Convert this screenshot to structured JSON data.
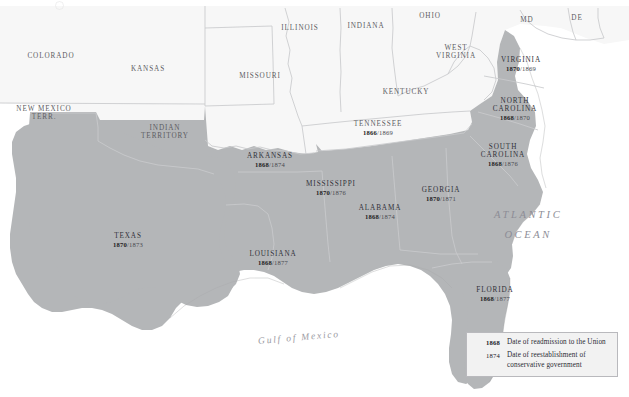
{
  "map": {
    "title": "Reconstruction of the Southern States",
    "colors": {
      "reconstructed_fill": "#b4b6b8",
      "union_fill": "#f7f7f7",
      "ocean_fill": "#ffffff",
      "border_stroke": "#c9cacc",
      "coast_stroke": "#a8a9ab",
      "label_text": "#3b3b40",
      "legend_bg": "#f2f2f2",
      "legend_border": "#b9b9bd"
    },
    "water_labels": [
      {
        "name": "atlantic-ocean",
        "line1": "ATLANTIC",
        "line2": "OCEAN"
      },
      {
        "name": "gulf-of-mexico",
        "text": "Gulf of Mexico"
      }
    ],
    "reconstructed_states": [
      {
        "name": "VIRGINIA",
        "readmission": "1870",
        "separator": "/",
        "conservative": "1869"
      },
      {
        "name": "NORTH CAROLINA",
        "readmission": "1868",
        "separator": "/",
        "conservative": "1870"
      },
      {
        "name": "SOUTH CAROLINA",
        "readmission": "1868",
        "separator": "/",
        "conservative": "1876"
      },
      {
        "name": "GEORGIA",
        "readmission": "1870",
        "separator": "/",
        "conservative": "1871"
      },
      {
        "name": "FLORIDA",
        "readmission": "1868",
        "separator": "/",
        "conservative": "1877"
      },
      {
        "name": "ALABAMA",
        "readmission": "1868",
        "separator": "/",
        "conservative": "1874"
      },
      {
        "name": "MISSISSIPPI",
        "readmission": "1870",
        "separator": "/",
        "conservative": "1876"
      },
      {
        "name": "LOUISIANA",
        "readmission": "1868",
        "separator": "/",
        "conservative": "1877"
      },
      {
        "name": "ARKANSAS",
        "readmission": "1868",
        "separator": "/",
        "conservative": "1874"
      },
      {
        "name": "TEXAS",
        "readmission": "1870",
        "separator": "/",
        "conservative": "1873"
      }
    ],
    "unshaded_states": [
      {
        "name": "TENNESSEE",
        "readmission": "1866",
        "separator": "/",
        "conservative": "1869"
      },
      {
        "name": "COLORADO"
      },
      {
        "name": "KANSAS"
      },
      {
        "name": "MISSOURI"
      },
      {
        "name": "ILLINOIS"
      },
      {
        "name": "INDIANA"
      },
      {
        "name": "OHIO"
      },
      {
        "name": "KENTUCKY"
      },
      {
        "name": "WEST VIRGINIA"
      },
      {
        "name": "MD"
      },
      {
        "name": "DE"
      }
    ],
    "territories": [
      {
        "name": "NEW MEXICO TERR."
      },
      {
        "name": "INDIAN TERRITORY"
      }
    ]
  },
  "legend": {
    "rows": [
      {
        "year": "1868",
        "bold": true,
        "text": "Date of readmission to the Union"
      },
      {
        "year": "1874",
        "bold": false,
        "text": "Date of reestablishment of conservative government"
      }
    ]
  }
}
